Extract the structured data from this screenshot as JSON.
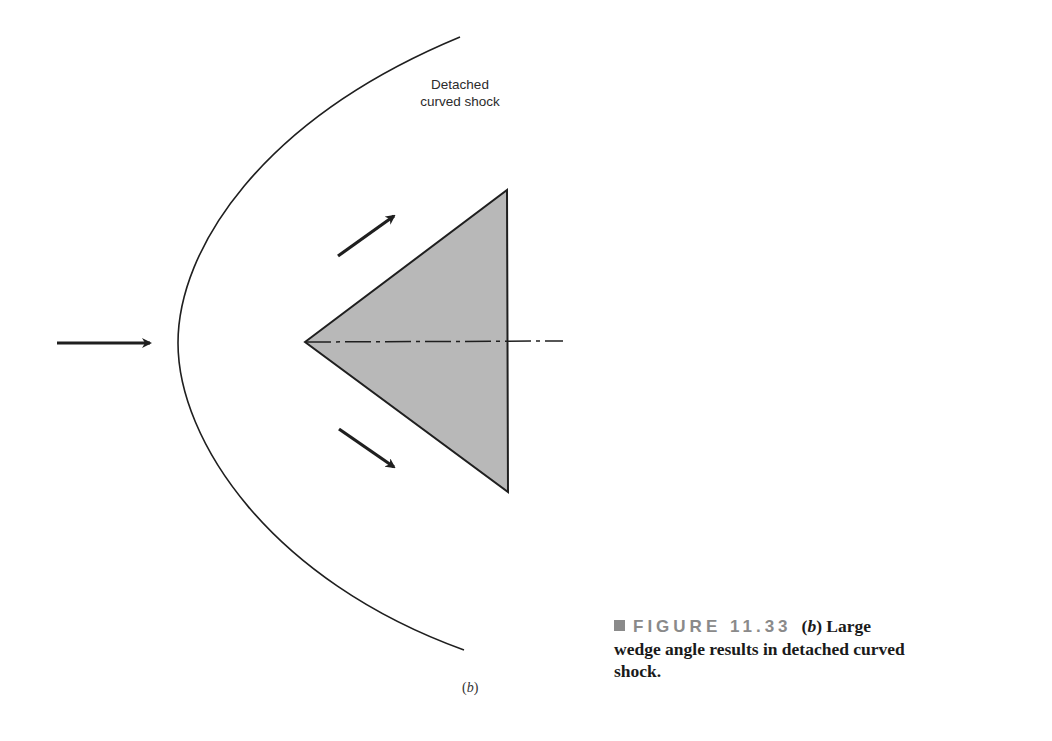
{
  "figure": {
    "shock_label_line1": "Detached",
    "shock_label_line2": "curved shock",
    "sub_label_open": "(",
    "sub_label_letter": "b",
    "sub_label_close": ")",
    "caption": {
      "figure_number": "FIGURE 11.33",
      "part_open": "(",
      "part_letter": "b",
      "part_close": ")",
      "text_line1": " Large",
      "text_rest": "wedge angle results in detached curved shock."
    }
  },
  "colors": {
    "wedge_fill": "#b8b8b8",
    "stroke": "#1f1f1f",
    "caption_gray": "#8a8a8a"
  }
}
